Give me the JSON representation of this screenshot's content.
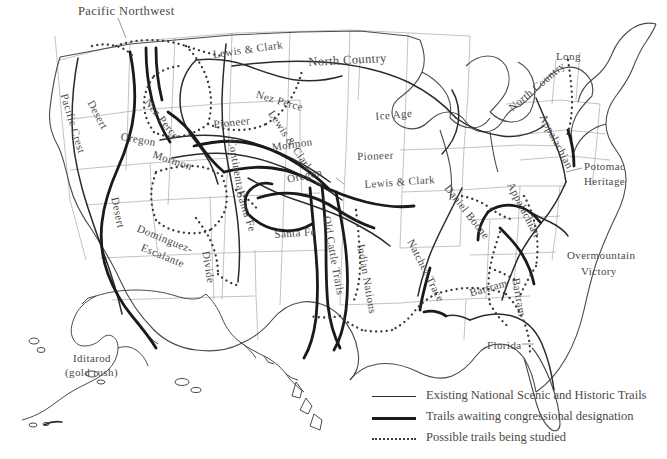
{
  "map": {
    "title": "National Trails System Map",
    "background_color": "#ffffff",
    "border_color": "#8e8e8e",
    "coast_color": "#4a4a4a",
    "trail_existing_color": "#2b2b2b",
    "trail_awaiting_color": "#1a1a1a",
    "trail_studied_color": "#3a3a3a"
  },
  "legend": {
    "items": [
      {
        "style": "thin-solid",
        "label": "Existing National Scenic and Historic Trails"
      },
      {
        "style": "thick-solid",
        "label": "Trails awaiting congressional designation"
      },
      {
        "style": "dotted",
        "label": "Possible trails being studied"
      }
    ]
  },
  "labels": [
    {
      "text": "Pacific Northwest",
      "x": 78,
      "y": 4,
      "rot": 0,
      "size": "lbl-lg"
    },
    {
      "text": "Lewis & Clark",
      "x": 212,
      "y": 48,
      "rot": -8,
      "size": "lbl-md"
    },
    {
      "text": "North Country",
      "x": 308,
      "y": 55,
      "rot": -3,
      "size": "lbl-lg"
    },
    {
      "text": "Long",
      "x": 556,
      "y": 50,
      "rot": 0,
      "size": "lbl-md"
    },
    {
      "text": "Desert",
      "x": 96,
      "y": 98,
      "rot": 62,
      "size": "lbl-md"
    },
    {
      "text": "Pacific Crest",
      "x": 70,
      "y": 92,
      "rot": 73,
      "size": "lbl-md"
    },
    {
      "text": "Nez Perce",
      "x": 152,
      "y": 96,
      "rot": 52,
      "size": "lbl-md"
    },
    {
      "text": "Nez Perce",
      "x": 258,
      "y": 88,
      "rot": 16,
      "size": "lbl-md"
    },
    {
      "text": "Lewis & Clark",
      "x": 276,
      "y": 108,
      "rot": 56,
      "size": "lbl-md"
    },
    {
      "text": "Ice Age",
      "x": 375,
      "y": 110,
      "rot": -5,
      "size": "lbl-md"
    },
    {
      "text": "North Country",
      "x": 506,
      "y": 104,
      "rot": -40,
      "size": "lbl-md"
    },
    {
      "text": "Appalachian",
      "x": 548,
      "y": 112,
      "rot": 62,
      "size": "lbl-md"
    },
    {
      "text": "Oregon",
      "x": 122,
      "y": 130,
      "rot": 10,
      "size": "lbl-md"
    },
    {
      "text": "Pioneer",
      "x": 213,
      "y": 118,
      "rot": -6,
      "size": "lbl-md"
    },
    {
      "text": "Mormon",
      "x": 155,
      "y": 148,
      "rot": 18,
      "size": "lbl-md"
    },
    {
      "text": "Mormon",
      "x": 271,
      "y": 141,
      "rot": -8,
      "size": "lbl-md"
    },
    {
      "text": "Pioneer",
      "x": 357,
      "y": 150,
      "rot": -2,
      "size": "lbl-md"
    },
    {
      "text": "Potomac",
      "x": 584,
      "y": 160,
      "rot": 0,
      "size": "lbl-md"
    },
    {
      "text": "Heritage",
      "x": 584,
      "y": 175,
      "rot": 0,
      "size": "lbl-md"
    },
    {
      "text": "Continental",
      "x": 238,
      "y": 138,
      "rot": 80,
      "size": "lbl-md"
    },
    {
      "text": "Oregon",
      "x": 286,
      "y": 173,
      "rot": -12,
      "size": "lbl-md"
    },
    {
      "text": "Lewis & Clark",
      "x": 364,
      "y": 178,
      "rot": -4,
      "size": "lbl-md"
    },
    {
      "text": "Appalachian",
      "x": 516,
      "y": 180,
      "rot": 63,
      "size": "lbl-md"
    },
    {
      "text": "Daniel Boone",
      "x": 452,
      "y": 182,
      "rot": 52,
      "size": "lbl-md"
    },
    {
      "text": "Santa Fe",
      "x": 246,
      "y": 190,
      "rot": 72,
      "size": "lbl-md"
    },
    {
      "text": "Santa Fe",
      "x": 274,
      "y": 228,
      "rot": -4,
      "size": "lbl-md"
    },
    {
      "text": "Desert",
      "x": 121,
      "y": 196,
      "rot": 78,
      "size": "lbl-md"
    },
    {
      "text": "Dominguez-",
      "x": 140,
      "y": 222,
      "rot": 22,
      "size": "lbl-md"
    },
    {
      "text": "Escalante",
      "x": 144,
      "y": 241,
      "rot": 22,
      "size": "lbl-md"
    },
    {
      "text": "Divide",
      "x": 212,
      "y": 250,
      "rot": 80,
      "size": "lbl-md"
    },
    {
      "text": "Old Cattle Trails",
      "x": 333,
      "y": 215,
      "rot": 80,
      "size": "lbl-md"
    },
    {
      "text": "Indian Nations",
      "x": 367,
      "y": 243,
      "rot": 80,
      "size": "lbl-md"
    },
    {
      "text": "Natchez Trace",
      "x": 416,
      "y": 237,
      "rot": 63,
      "size": "lbl-md"
    },
    {
      "text": "Overmountain",
      "x": 567,
      "y": 249,
      "rot": 0,
      "size": "lbl-md"
    },
    {
      "text": "Victory",
      "x": 581,
      "y": 265,
      "rot": 0,
      "size": "lbl-md"
    },
    {
      "text": "Bartram",
      "x": 468,
      "y": 287,
      "rot": -16,
      "size": "lbl-md"
    },
    {
      "text": "Bartram",
      "x": 522,
      "y": 277,
      "rot": 80,
      "size": "lbl-md"
    },
    {
      "text": "Florida",
      "x": 487,
      "y": 339,
      "rot": 0,
      "size": "lbl-md"
    },
    {
      "text": "Iditarod",
      "x": 73,
      "y": 352,
      "rot": 0,
      "size": "lbl-md"
    },
    {
      "text": "(gold rush)",
      "x": 65,
      "y": 366,
      "rot": 0,
      "size": "lbl-md"
    }
  ]
}
